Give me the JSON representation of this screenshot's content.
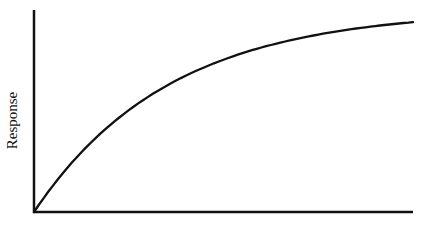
{
  "chart_data": {
    "type": "line",
    "title": "",
    "xlabel": "",
    "ylabel": "Response",
    "xlim": [
      0,
      1
    ],
    "ylim": [
      0,
      1
    ],
    "grid": false,
    "legend": null,
    "ticks": {
      "x": [],
      "y": []
    },
    "series": [
      {
        "name": "response-curve",
        "shape": "saturating (concave, exponential approach to plateau)",
        "x": [
          0.0,
          0.1,
          0.2,
          0.3,
          0.4,
          0.5,
          0.6,
          0.7,
          0.8,
          0.9,
          1.0
        ],
        "y": [
          0.0,
          0.2,
          0.37,
          0.51,
          0.62,
          0.71,
          0.78,
          0.84,
          0.88,
          0.91,
          0.94
        ]
      }
    ]
  },
  "colors": {
    "background": "#ffffff",
    "axis": "#111111",
    "curve": "#111111"
  },
  "axes": {
    "origin_px": [
      34,
      212
    ],
    "x_end_px": 413,
    "y_top_px": 10
  }
}
